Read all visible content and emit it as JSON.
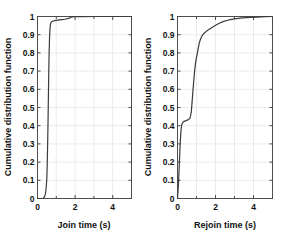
{
  "figure": {
    "background_color": "#ffffff",
    "panel_count": 2,
    "axis_color": "#4d4d4d",
    "grid_color": "#ebebeb",
    "curve_color": "#3b3b3b"
  },
  "chart_data": [
    {
      "type": "line",
      "panel": "left",
      "title": "",
      "xlabel": "Join time (s)",
      "ylabel": "Cumulative distribution function",
      "xlim": [
        0,
        5
      ],
      "ylim": [
        0,
        1
      ],
      "xticks": [
        0,
        2,
        4
      ],
      "xticklabels": [
        "0",
        "2",
        "4"
      ],
      "xminorticks": [
        1,
        3,
        5
      ],
      "yticks": [
        0,
        0.1,
        0.2,
        0.3,
        0.4,
        0.5,
        0.6,
        0.7,
        0.8,
        0.9,
        1
      ],
      "yticklabels": [
        "0",
        "0.1",
        "0.2",
        "0.3",
        "0.4",
        "0.5",
        "0.6",
        "0.7",
        "0.8",
        "0.9",
        "1"
      ],
      "grid": true,
      "legend": null,
      "series": [
        {
          "name": "Join time CDF",
          "x": [
            0.0,
            0.3,
            0.38,
            0.43,
            0.47,
            0.5,
            0.52,
            0.54,
            0.56,
            0.58,
            0.6,
            0.62,
            0.64,
            0.66,
            0.68,
            0.7,
            0.74,
            0.8,
            0.9,
            1.0,
            1.15,
            1.3,
            1.45,
            1.6,
            1.7,
            1.78,
            1.85,
            2.0,
            2.4,
            3.0,
            3.6,
            4.0,
            5.0
          ],
          "y": [
            0.0,
            0.0,
            0.01,
            0.03,
            0.07,
            0.12,
            0.2,
            0.3,
            0.42,
            0.56,
            0.7,
            0.81,
            0.88,
            0.925,
            0.95,
            0.962,
            0.97,
            0.974,
            0.977,
            0.979,
            0.981,
            0.983,
            0.985,
            0.988,
            0.991,
            0.996,
            0.998,
            0.999,
            0.999,
            1.0,
            1.0,
            1.0,
            1.0
          ]
        }
      ]
    },
    {
      "type": "line",
      "panel": "right",
      "title": "",
      "xlabel": "Rejoin time (s)",
      "ylabel": "Cumulative distribution function",
      "xlim": [
        0,
        5
      ],
      "ylim": [
        0,
        1
      ],
      "xticks": [
        0,
        2,
        4
      ],
      "xticklabels": [
        "0",
        "2",
        "4"
      ],
      "xminorticks": [
        1,
        3,
        5
      ],
      "yticks": [
        0,
        0.1,
        0.2,
        0.3,
        0.4,
        0.5,
        0.6,
        0.7,
        0.8,
        0.9,
        1
      ],
      "yticklabels": [
        "0",
        "0.1",
        "0.2",
        "0.3",
        "0.4",
        "0.5",
        "0.6",
        "0.7",
        "0.8",
        "0.9",
        "1"
      ],
      "grid": true,
      "legend": null,
      "series": [
        {
          "name": "Rejoin time CDF",
          "x": [
            0.0,
            0.05,
            0.1,
            0.14,
            0.18,
            0.22,
            0.28,
            0.35,
            0.45,
            0.55,
            0.65,
            0.72,
            0.76,
            0.8,
            0.85,
            0.9,
            0.95,
            1.0,
            1.05,
            1.1,
            1.15,
            1.2,
            1.3,
            1.4,
            1.5,
            1.65,
            1.8,
            2.0,
            2.2,
            2.4,
            2.7,
            3.0,
            3.4,
            3.8,
            4.2,
            4.6,
            5.0
          ],
          "y": [
            0.0,
            0.08,
            0.2,
            0.3,
            0.37,
            0.405,
            0.418,
            0.424,
            0.428,
            0.432,
            0.44,
            0.47,
            0.52,
            0.575,
            0.64,
            0.7,
            0.745,
            0.775,
            0.8,
            0.83,
            0.855,
            0.872,
            0.895,
            0.908,
            0.917,
            0.928,
            0.938,
            0.952,
            0.963,
            0.972,
            0.981,
            0.987,
            0.992,
            0.995,
            0.997,
            0.999,
            1.0
          ]
        }
      ]
    }
  ]
}
